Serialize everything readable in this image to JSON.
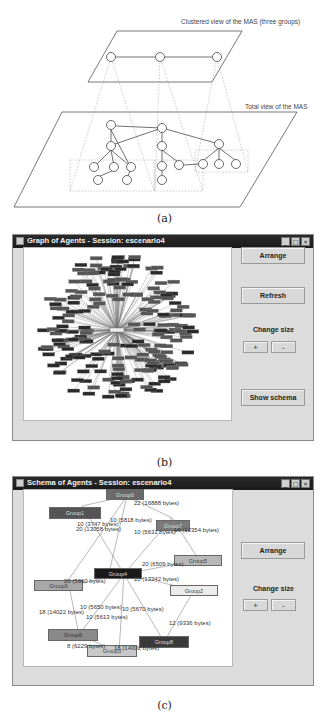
{
  "figure_a": {
    "top_plane_label": "Clustered view of the MAS (three groups)",
    "bottom_plane_label": "Total view of the MAS",
    "caption": "(a)"
  },
  "figure_b": {
    "window_title": "Graph of Agents - Session: escenario4",
    "window_controls": [
      "_",
      "□",
      "×"
    ],
    "buttons": {
      "arrange": "Arrange",
      "refresh": "Refresh",
      "change_size_label": "Change size",
      "plus": "+",
      "minus": "-",
      "show_schema": "Show schema"
    },
    "caption": "(b)"
  },
  "figure_c": {
    "window_title": "Schema of Agents - Session: escenario4",
    "window_controls": [
      "_",
      "□",
      "×"
    ],
    "buttons": {
      "arrange": "Arrange",
      "change_size_label": "Change size",
      "plus": "+",
      "minus": "-"
    },
    "nodes": [
      {
        "id": "group0",
        "label": "Group0"
      },
      {
        "id": "group1",
        "label": "Group1"
      },
      {
        "id": "group2",
        "label": "Group2"
      },
      {
        "id": "group3",
        "label": "Group3"
      },
      {
        "id": "group4",
        "label": "Group4"
      },
      {
        "id": "group5",
        "label": "Group5"
      },
      {
        "id": "group6",
        "label": "Group6"
      },
      {
        "id": "group7",
        "label": "Group7"
      },
      {
        "id": "group8",
        "label": "Group8"
      },
      {
        "id": "group9",
        "label": "Group9"
      }
    ],
    "edge_labels": [
      "22 (16888 bytes)",
      "10 (5818 bytes)",
      "10 (3747 bytes)",
      "20 (13058 bytes)",
      "10 (5631 bytes)",
      "16 (12354 bytes)",
      "20 (5960 bytes)",
      "20 (6509 bytes)",
      "20 (13342 bytes)",
      "10 (5650 bytes)",
      "18 (14022 bytes)",
      "10 (5670 bytes)",
      "10 (5613 bytes)",
      "12 (9336 bytes)",
      "8 (6229 bytes)",
      "18 (14002 bytes)"
    ],
    "caption": "(c)"
  }
}
